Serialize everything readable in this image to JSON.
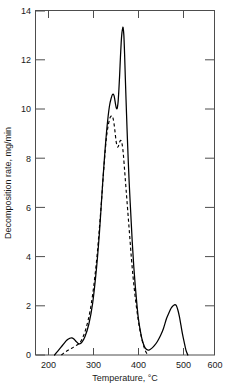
{
  "chart_data": {
    "type": "line",
    "title": "",
    "xlabel": "Temperature, °C",
    "ylabel": "Decomposition rate, mg/min",
    "xlim": [
      150,
      620
    ],
    "ylim": [
      0,
      14
    ],
    "grid": false,
    "legend": "none",
    "xticks": [
      200,
      300,
      400,
      500,
      600
    ],
    "xtick_labels": [
      "200",
      "300",
      "400",
      "500",
      "600"
    ],
    "yticks": [
      0,
      2,
      4,
      6,
      8,
      10,
      12,
      14
    ],
    "ytick_labels": [
      "0",
      "2",
      "4",
      "6",
      "8",
      "10",
      "12",
      "14"
    ],
    "series": [
      {
        "name": "solid-curve",
        "style": "solid",
        "color": "#000000",
        "x": [
          200,
          208,
          216,
          224,
          232,
          240,
          245,
          250,
          256,
          262,
          266,
          272,
          280,
          290,
          300,
          310,
          318,
          326,
          332,
          338,
          344,
          349,
          353,
          356,
          358,
          360,
          362,
          364,
          365,
          367,
          369,
          371,
          373,
          375,
          377,
          379,
          380,
          382,
          384,
          386,
          389,
          392,
          396,
          400,
          404,
          408,
          412,
          416,
          420,
          425,
          430,
          436,
          442,
          448,
          455,
          462,
          470,
          478,
          486,
          494,
          500,
          506,
          510,
          514,
          517,
          520,
          524,
          528,
          532,
          536,
          540,
          545,
          550
        ],
        "y": [
          0.0,
          0.15,
          0.3,
          0.45,
          0.6,
          0.68,
          0.7,
          0.66,
          0.56,
          0.47,
          0.45,
          0.52,
          0.75,
          1.25,
          2.1,
          3.5,
          5.0,
          6.9,
          8.2,
          9.3,
          10.1,
          10.45,
          10.6,
          10.55,
          10.4,
          10.2,
          10.05,
          10.0,
          10.05,
          10.3,
          10.8,
          11.4,
          12.1,
          12.7,
          13.1,
          13.28,
          13.3,
          13.0,
          12.2,
          11.2,
          9.8,
          8.5,
          7.0,
          5.8,
          4.6,
          3.6,
          2.8,
          2.1,
          1.5,
          1.0,
          0.62,
          0.35,
          0.22,
          0.2,
          0.27,
          0.38,
          0.55,
          0.78,
          1.08,
          1.48,
          1.7,
          1.9,
          1.98,
          2.03,
          2.05,
          2.0,
          1.82,
          1.55,
          1.2,
          0.85,
          0.55,
          0.2,
          0.0
        ]
      },
      {
        "name": "dashed-curve",
        "style": "dashed",
        "color": "#000000",
        "x": [
          218,
          226,
          234,
          242,
          250,
          258,
          264,
          270,
          276,
          282,
          288,
          294,
          300,
          306,
          312,
          318,
          323,
          328,
          332,
          336,
          340,
          344,
          347,
          350,
          352,
          354,
          356,
          358,
          360,
          362,
          364,
          366,
          368,
          370,
          372,
          374,
          375,
          377,
          379,
          381,
          384,
          387,
          390,
          394,
          398,
          402,
          406,
          410,
          415,
          420,
          425,
          430,
          435,
          440,
          445
        ],
        "y": [
          0.0,
          0.1,
          0.18,
          0.25,
          0.32,
          0.4,
          0.46,
          0.58,
          0.78,
          1.05,
          1.4,
          1.85,
          2.45,
          3.2,
          4.1,
          5.2,
          6.2,
          7.3,
          8.1,
          8.8,
          9.25,
          9.55,
          9.68,
          9.72,
          9.7,
          9.6,
          9.42,
          9.18,
          8.9,
          8.65,
          8.5,
          8.45,
          8.5,
          8.6,
          8.7,
          8.72,
          8.7,
          8.6,
          8.4,
          8.1,
          7.5,
          6.9,
          6.3,
          5.5,
          4.7,
          3.9,
          3.2,
          2.6,
          1.95,
          1.4,
          0.95,
          0.6,
          0.32,
          0.12,
          0.0
        ]
      }
    ]
  },
  "axis": {
    "x_title": "Temperature, °C",
    "y_title": "Decomposition rate, mg/min"
  },
  "x_labels": {
    "t200": "200",
    "t300": "300",
    "t400": "400",
    "t500": "500",
    "t600": "600"
  },
  "y_labels": {
    "v0": "0",
    "v2": "2",
    "v4": "4",
    "v6": "6",
    "v8": "8",
    "v10": "10",
    "v12": "12",
    "v14": "14"
  }
}
